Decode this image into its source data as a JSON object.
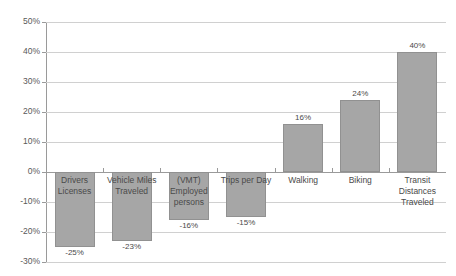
{
  "chart_data": {
    "type": "bar",
    "title": "",
    "subtitle": "",
    "xlabel": "",
    "ylabel": "",
    "ylim": [
      -30,
      50
    ],
    "ytick_labels": [
      "50%",
      "40%",
      "30%",
      "20%",
      "10%",
      "0%",
      "-10%",
      "-20%",
      "-30%"
    ],
    "ytick_values": [
      50,
      40,
      30,
      20,
      10,
      0,
      -10,
      -20,
      -30
    ],
    "grid": true,
    "legend": false,
    "legend_position": "none",
    "bar_color": "#a6a6a6",
    "bar_border_color": "#919191",
    "gridline_color": "#d0d0d0",
    "axis_color": "#9a9a9a",
    "text_color": "#4a4a4a",
    "categories": [
      "Drivers Licenses",
      "Vehicle Miles Traveled",
      "(VMT) Employed persons",
      "Trips per Day",
      "Walking",
      "Biking",
      "Transit Distances Traveled"
    ],
    "values": [
      -25,
      -23,
      -16,
      -15,
      16,
      24,
      40
    ],
    "value_labels": [
      "-25%",
      "-23%",
      "-16%",
      "-15%",
      "16%",
      "24%",
      "40%"
    ]
  }
}
